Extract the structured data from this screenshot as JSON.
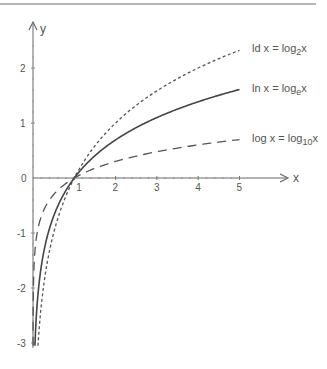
{
  "chart_data": {
    "type": "line",
    "title": "",
    "xlabel": "x",
    "ylabel": "y",
    "xlim": [
      0,
      5.9
    ],
    "ylim": [
      -3.1,
      2.8
    ],
    "x_ticks": [
      "1",
      "2",
      "3",
      "4",
      "5"
    ],
    "y_ticks": [
      "2",
      "1",
      "0",
      "-1",
      "-2",
      "-3"
    ],
    "grid": false,
    "legend_position": "inline-right",
    "series": [
      {
        "name": "ld x = log₂x",
        "label_main": "ld x = log",
        "label_sub": "2",
        "label_tail": "x",
        "function": "log2",
        "style": "short-dash",
        "x": [
          0.125,
          0.25,
          0.5,
          1,
          2,
          3,
          4,
          5
        ],
        "values": [
          -3,
          -2,
          -1,
          0,
          1,
          1.585,
          2,
          2.322
        ]
      },
      {
        "name": "ln x = logₑx",
        "label_main": "ln x = log",
        "label_sub": "e",
        "label_tail": "x",
        "function": "ln",
        "style": "solid",
        "x": [
          0.05,
          0.1,
          0.25,
          0.5,
          1,
          2,
          3,
          4,
          5
        ],
        "values": [
          -3,
          -2.303,
          -1.386,
          -0.693,
          0,
          0.693,
          1.099,
          1.386,
          1.609
        ]
      },
      {
        "name": "log x = log₁₀x",
        "label_main": "log x = log",
        "label_sub": "10",
        "label_tail": "x",
        "function": "log10",
        "style": "long-dash",
        "x": [
          0.001,
          0.01,
          0.1,
          0.5,
          1,
          2,
          3,
          4,
          5
        ],
        "values": [
          -3,
          -2,
          -1,
          -0.301,
          0,
          0.301,
          0.477,
          0.602,
          0.699
        ]
      }
    ]
  },
  "axes": {
    "x_label": "x",
    "y_label": "y",
    "origin_label": "0"
  }
}
